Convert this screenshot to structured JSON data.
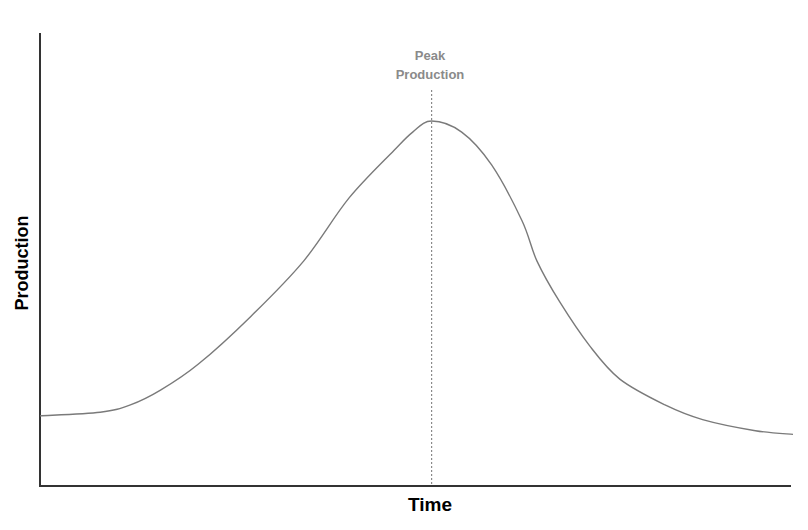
{
  "chart_data": {
    "type": "line",
    "title": "",
    "xlabel": "Time",
    "ylabel": "Production",
    "grid": false,
    "legend": null,
    "x_ticks": [],
    "y_ticks": [],
    "xlim": [
      0,
      100
    ],
    "ylim": [
      0,
      100
    ],
    "series": [
      {
        "name": "Production curve",
        "color": "#7a7a7a",
        "x": [
          0,
          8,
          12,
          16,
          21,
          28,
          35,
          41,
          47,
          49.5,
          52,
          56,
          60,
          64,
          66,
          69,
          73,
          77,
          83,
          88,
          95,
          100
        ],
        "values": [
          19,
          20,
          22,
          26,
          33,
          46,
          61,
          78,
          91,
          96,
          99,
          96,
          87,
          72,
          61,
          50,
          38,
          29,
          22,
          18,
          15,
          14
        ]
      }
    ],
    "annotations": [
      {
        "type": "vertical-dotted-line",
        "x": 52,
        "label": "Peak Production",
        "label_lines": [
          "Peak",
          "Production"
        ],
        "color": "#8a8a8a"
      }
    ]
  },
  "labels": {
    "annotation_line1": "Peak",
    "annotation_line2": "Production",
    "xlabel": "Time",
    "ylabel": "Production"
  }
}
